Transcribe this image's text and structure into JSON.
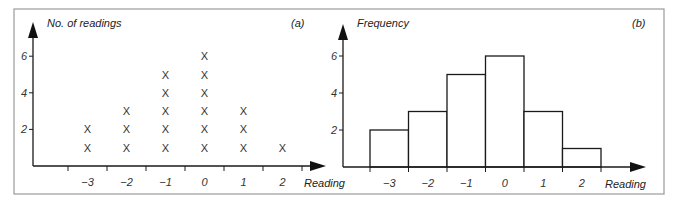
{
  "chart_data": [
    {
      "type": "scatter",
      "subtype": "dot-plot",
      "panel_label": "(a)",
      "title": "",
      "ylabel": "No. of readings",
      "xlabel": "Reading",
      "categories": [
        "−3",
        "−2",
        "−1",
        "0",
        "1",
        "2"
      ],
      "x": [
        -3,
        -2,
        -1,
        0,
        1,
        2
      ],
      "values": [
        2,
        3,
        5,
        6,
        3,
        1
      ],
      "marker": "X",
      "yticks": [
        "2",
        "4",
        "6"
      ],
      "ytick_values": [
        2,
        4,
        6
      ],
      "ylim": [
        0,
        7
      ],
      "grid": false,
      "legend": "none"
    },
    {
      "type": "bar",
      "subtype": "histogram",
      "panel_label": "(b)",
      "title": "",
      "ylabel": "Frequency",
      "xlabel": "Reading",
      "categories": [
        "−3",
        "−2",
        "−1",
        "0",
        "1",
        "2"
      ],
      "x": [
        -3,
        -2,
        -1,
        0,
        1,
        2
      ],
      "values": [
        2,
        3,
        5,
        6,
        3,
        1
      ],
      "yticks": [
        "2",
        "4",
        "6"
      ],
      "ytick_values": [
        2,
        4,
        6
      ],
      "ylim": [
        0,
        7
      ],
      "grid": false,
      "legend": "none"
    }
  ]
}
